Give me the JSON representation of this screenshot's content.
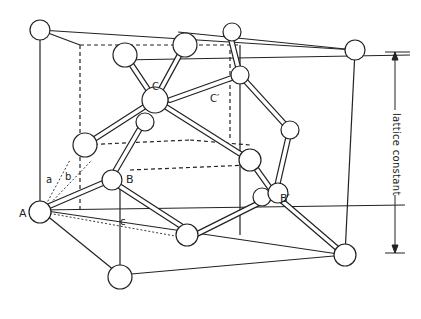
{
  "diagram": {
    "labels": {
      "A": "A",
      "B": "B",
      "B_prime": "B′",
      "C": "C",
      "C_prime": "C′",
      "a": "a",
      "b": "b",
      "c": "c"
    },
    "dimension_label": "lattice constant",
    "colors": {
      "line": "#222222",
      "atom_fill": "#ffffff",
      "background": "#ffffff"
    }
  }
}
